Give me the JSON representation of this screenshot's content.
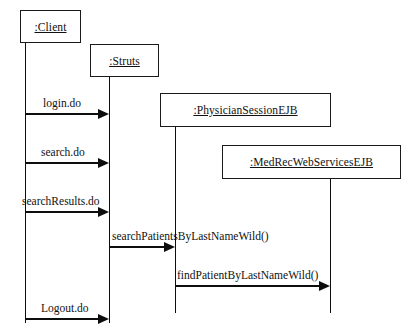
{
  "diagram": {
    "kind": "uml-sequence-diagram",
    "width": 405,
    "height": 331,
    "background_color": "#ffffff",
    "line_color": "#0d0d0d",
    "text_color": "#111111"
  },
  "lifelines": [
    {
      "id": "client",
      "label": ":Client",
      "box": {
        "x": 20,
        "y": 10,
        "w": 61,
        "h": 33
      },
      "stem": {
        "x": 25,
        "y": 43,
        "h": 280
      }
    },
    {
      "id": "struts",
      "label": ":Struts",
      "box": {
        "x": 90,
        "y": 44,
        "w": 69,
        "h": 33
      },
      "stem": {
        "x": 109,
        "y": 77,
        "h": 246
      }
    },
    {
      "id": "physician-session-ejb",
      "label": ":PhysicianSessionEJB",
      "box": {
        "x": 160,
        "y": 93,
        "w": 171,
        "h": 34
      },
      "stem": {
        "x": 175,
        "y": 127,
        "h": 186
      }
    },
    {
      "id": "medrec-web-services-ejb",
      "label": ":MedRecWebServicesEJB",
      "box": {
        "x": 222,
        "y": 145,
        "w": 179,
        "h": 34
      },
      "stem": {
        "x": 330,
        "y": 179,
        "h": 134
      }
    }
  ],
  "messages": [
    {
      "id": "login",
      "label": "login.do",
      "from": "client",
      "to": "struts",
      "x1": 25,
      "x2": 109,
      "y": 113,
      "label_x": 43
    },
    {
      "id": "search",
      "label": "search.do",
      "from": "client",
      "to": "struts",
      "x1": 25,
      "x2": 109,
      "y": 162,
      "label_x": 41
    },
    {
      "id": "search-results",
      "label": "searchResults.do",
      "from": "client",
      "to": "struts",
      "x1": 25,
      "x2": 109,
      "y": 211,
      "label_x": 22
    },
    {
      "id": "search-patients-by-last-name-wild",
      "label": "searchPatientsByLastNameWild()",
      "from": "struts",
      "to": "physician-session-ejb",
      "x1": 109,
      "x2": 175,
      "y": 246,
      "label_x": 112
    },
    {
      "id": "find-patient-by-last-name-wild",
      "label": "findPatientByLastNameWild()",
      "from": "physician-session-ejb",
      "to": "medrec-web-services-ejb",
      "x1": 175,
      "x2": 330,
      "y": 285,
      "label_x": 177
    },
    {
      "id": "logout",
      "label": "Logout.do",
      "from": "client",
      "to": "struts",
      "x1": 25,
      "x2": 109,
      "y": 318,
      "label_x": 41
    }
  ]
}
